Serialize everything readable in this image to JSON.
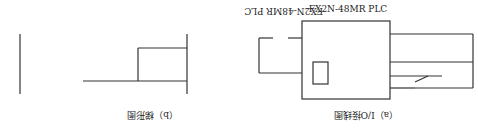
{
  "io_diagram": {
    "caption": "（a）I/O接线图",
    "plc_label": "FX2N-48MR PLC",
    "plc_left_terminals": [
      "X002",
      "X001",
      "COM"
    ],
    "plc_right_terminals": [
      "Y001",
      "COM"
    ],
    "inputs": [
      "SB2",
      "SB1"
    ],
    "load_label": "KM",
    "supply_symbol": "~"
  },
  "ladder_diagram": {
    "caption": "（b）梯形图",
    "contact_x2": "X₂",
    "contact_x1": "X₁",
    "parallel_contact": "Y001",
    "output_coil": "Y001"
  }
}
